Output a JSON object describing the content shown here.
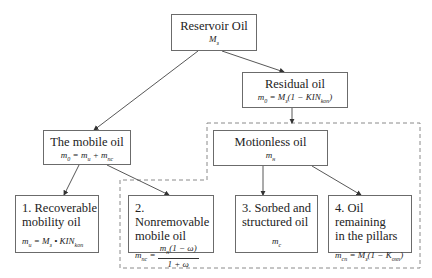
{
  "diagram": {
    "nodes": {
      "reservoir": {
        "title": "Reservoir Oil",
        "formula_var": "M",
        "formula_sub": "з"
      },
      "residual": {
        "title": "Residual oil",
        "formula_lhs": "m",
        "formula_lhs_sub": "0",
        "formula_rhs_a": " = M",
        "formula_rhs_a_sub": "з",
        "formula_rhs_b": "(1 − KIN",
        "formula_rhs_b_sub": "kon",
        "formula_rhs_c": ")"
      },
      "mobile": {
        "title": "The mobile oil",
        "formula_lhs": "m",
        "formula_lhs_sub": "0",
        "formula_a": " = m",
        "formula_a_sub": "u",
        "formula_b": " + m",
        "formula_b_sub": "nc"
      },
      "motionless": {
        "title": "Motionless oil",
        "formula_var": "m",
        "formula_sub": "н"
      },
      "recoverable": {
        "title_line1": "1. Recoverable",
        "title_line2": "mobility oil",
        "formula_lhs": "m",
        "formula_lhs_sub": "u",
        "formula_rhs": " = M",
        "formula_rhs_sub": "з",
        "formula_op": " • KIN",
        "formula_op_sub": "kon"
      },
      "nonremovable": {
        "title_line1": "2.  Nonremovable",
        "title_line2": "mobile oil",
        "formula_lhs": "m",
        "formula_lhs_sub": "nc",
        "formula_eq": " = ",
        "num_var": "m",
        "num_sub": "н",
        "num_rest": "(1 − ω)",
        "den": "1 + ω"
      },
      "sorbed": {
        "title_line1": "3. Sorbed and",
        "title_line2": "structured oil",
        "formula_var": "m",
        "formula_sub": "c"
      },
      "pillars": {
        "title_line1": "4. Oil remaining",
        "title_line2": "in the pillars",
        "formula_lhs": "m",
        "formula_lhs_sub": "cn",
        "formula_rhs": " = M",
        "formula_rhs_sub": "з",
        "formula_rest": "(1 − K",
        "formula_rest_sub": "oxn",
        "formula_close": ")"
      }
    },
    "edges": [
      {
        "from": "reservoir",
        "to": "mobile"
      },
      {
        "from": "reservoir",
        "to": "residual"
      },
      {
        "from": "residual",
        "to": "motionless"
      },
      {
        "from": "mobile",
        "to": "recoverable"
      },
      {
        "from": "mobile",
        "to": "nonremovable"
      },
      {
        "from": "motionless",
        "to": "sorbed"
      },
      {
        "from": "motionless",
        "to": "pillars"
      }
    ],
    "group": {
      "name": "motionless-group",
      "style": "dashed",
      "members": [
        "motionless",
        "nonremovable",
        "sorbed",
        "pillars"
      ]
    },
    "colors": {
      "border": "#6b6b6b",
      "line": "#444444",
      "dashed": "#8a8a8a",
      "background": "#ffffff"
    }
  }
}
